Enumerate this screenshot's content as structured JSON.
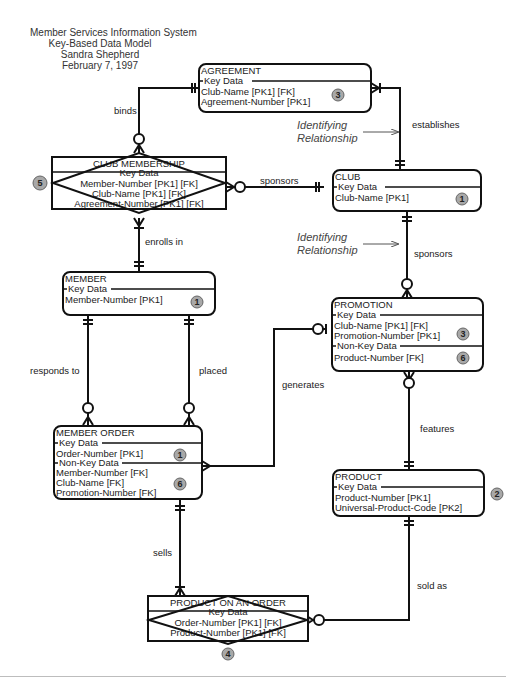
{
  "header": {
    "line1": "Member Services Information System",
    "line2": "Key-Based Data Model",
    "author": "Sandra Shepherd",
    "date": "February 7, 1997"
  },
  "entities": {
    "agreement": {
      "name": "AGREEMENT",
      "key_section": "Key Data",
      "key_attrs": [
        "Club-Name   [PK1]  [FK]",
        "Agreement-Number   [PK1]"
      ],
      "badge": "3"
    },
    "club_membership": {
      "name": "CLUB MEMBERSHIP",
      "key_section": "Key Data",
      "key_attrs": [
        "Member-Number   [PK1]  [FK]",
        "Club-Name   [PK1]  [FK]",
        "Agreement-Number   [PK1]  [FK]"
      ],
      "badge": "5"
    },
    "club": {
      "name": "CLUB",
      "key_section": "Key Data",
      "key_attrs": [
        "Club-Name   [PK1]"
      ],
      "badge": "1"
    },
    "member": {
      "name": "MEMBER",
      "key_section": "Key Data",
      "key_attrs": [
        "Member-Number   [PK1]"
      ],
      "badge": "1"
    },
    "promotion": {
      "name": "PROMOTION",
      "key_section": "Key Data",
      "key_attrs": [
        "Club-Name   [PK1]  [FK]",
        "Promotion-Number   [PK1]"
      ],
      "key_badge": "3",
      "nonkey_section": "Non-Key Data",
      "nonkey_attrs": [
        "Product-Number  [FK]"
      ],
      "nonkey_badge": "6"
    },
    "member_order": {
      "name": "MEMBER ORDER",
      "key_section": "Key Data",
      "key_attrs": [
        "Order-Number   [PK1]"
      ],
      "key_badge": "1",
      "nonkey_section": "Non-Key Data",
      "nonkey_attrs": [
        "Member-Number  [FK]",
        "Club-Name  [FK]",
        "Promotion-Number  [FK]"
      ],
      "nonkey_badge": "6"
    },
    "product": {
      "name": "PRODUCT",
      "key_section": "Key Data",
      "key_attrs": [
        "Product-Number   [PK1]",
        "Universal-Product-Code   [PK2]"
      ],
      "badge": "2"
    },
    "product_on_order": {
      "name": "PRODUCT ON AN ORDER",
      "key_section": "Key Data",
      "key_attrs": [
        "Order-Number   [PK1]  [FK]",
        "Product-Number   [PK1]  [FK]"
      ],
      "badge": "4"
    }
  },
  "relationships": {
    "binds": "binds",
    "establishes": "establishes",
    "sponsors_membership": "sponsors",
    "enrolls_in": "enrolls in",
    "sponsors_promotion": "sponsors",
    "responds_to": "responds to",
    "placed": "placed",
    "generates": "generates",
    "features": "features",
    "sells": "sells",
    "sold_as": "sold as"
  },
  "annotations": {
    "identifying_1_line1": "Identifying",
    "identifying_1_line2": "Relationship",
    "identifying_2_line1": "Identifying",
    "identifying_2_line2": "Relationship"
  }
}
